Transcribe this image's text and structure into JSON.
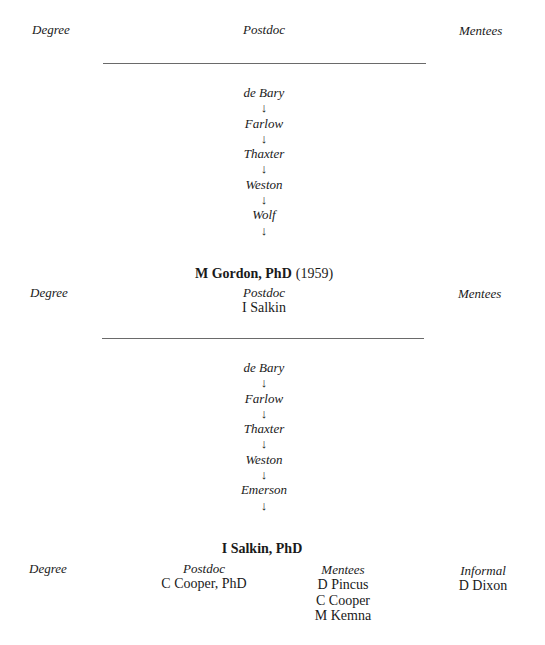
{
  "blocks": [
    {
      "header_row": {
        "degree_label": "Degree",
        "postdoc_label": "Postdoc",
        "mentees_label": "Mentees"
      },
      "lineage": [
        "de Bary",
        "Farlow",
        "Thaxter",
        "Weston",
        "Wolf"
      ],
      "arrow_glyph": "↓"
    },
    {
      "person": {
        "name": "M Gordon, PhD",
        "year": "(1959)"
      },
      "header_row": {
        "degree_label": "Degree",
        "postdoc_label": "Postdoc",
        "postdoc_values": [
          "I Salkin"
        ],
        "mentees_label": "Mentees"
      },
      "lineage": [
        "de Bary",
        "Farlow",
        "Thaxter",
        "Weston",
        "Emerson"
      ],
      "arrow_glyph": "↓"
    },
    {
      "person": {
        "name": "I Salkin, PhD"
      },
      "header_row": {
        "degree_label": "Degree",
        "postdoc_label": "Postdoc",
        "postdoc_values": [
          "C Cooper, PhD"
        ],
        "mentees_label": "Mentees",
        "mentees_values": [
          "D Pincus",
          "C Cooper",
          "M Kemna"
        ],
        "informal_label": "Informal",
        "informal_values": [
          "D Dixon"
        ]
      }
    }
  ]
}
